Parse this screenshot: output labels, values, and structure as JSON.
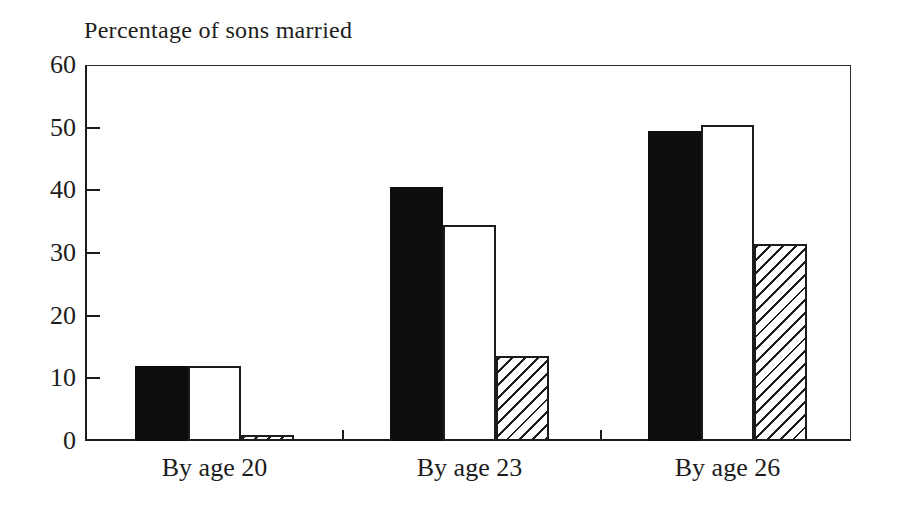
{
  "figure": {
    "background": "#ffffff",
    "ink_color": "#1c1c1c"
  },
  "chart_data": {
    "type": "bar",
    "title": "Percentage of sons married",
    "title_position": "top-left",
    "categories": [
      "By age 20",
      "By age 23",
      "By age 26"
    ],
    "series": [
      {
        "name": "black-solid",
        "pattern": "solid-black",
        "values": [
          12,
          40.5,
          49.5
        ]
      },
      {
        "name": "white-outlined",
        "pattern": "white-outline",
        "values": [
          12,
          34.5,
          50.5
        ]
      },
      {
        "name": "diagonal-hatched",
        "pattern": "diagonal-hatch",
        "values": [
          1,
          13.5,
          31.5
        ]
      }
    ],
    "xlabel": "",
    "ylabel": "Percentage of sons married",
    "ylim": [
      0,
      60
    ],
    "yticks": [
      0,
      10,
      20,
      30,
      40,
      50,
      60
    ],
    "grid": false,
    "legend_position": "none",
    "frame": "full-rectangle",
    "bar_colors": {
      "black": "#0e0e0e",
      "white": "#ffffff",
      "hatch_line": "#1c1c1c"
    }
  }
}
